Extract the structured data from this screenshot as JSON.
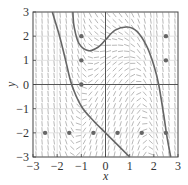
{
  "chart_data": {
    "type": "slope-field",
    "title": "",
    "xlabel": "x",
    "ylabel": "y",
    "xlim": [
      -3,
      3
    ],
    "ylim": [
      -3,
      3
    ],
    "grid": true,
    "x_ticks": [
      "-3",
      "-2",
      "-1",
      "0",
      "1",
      "2",
      "3"
    ],
    "y_ticks": [
      "-3",
      "-2",
      "-1",
      "0",
      "1",
      "2",
      "3"
    ],
    "marked_points": [
      [
        -1,
        2
      ],
      [
        -1,
        1
      ],
      [
        2.5,
        2
      ],
      [
        2.5,
        1
      ],
      [
        -1,
        0
      ],
      [
        -2.5,
        -2
      ],
      [
        -1.5,
        -2
      ],
      [
        -0.5,
        -2
      ],
      [
        0.5,
        -2
      ],
      [
        1.5,
        -2
      ],
      [
        2.5,
        -2
      ]
    ],
    "solution_curves": [
      {
        "name": "curve-a",
        "points": [
          [
            -2.2,
            3
          ],
          [
            -1.9,
            2
          ],
          [
            -1.65,
            1
          ],
          [
            -1.4,
            0
          ],
          [
            -1.0,
            -0.9
          ],
          [
            -0.5,
            -1.5
          ],
          [
            0,
            -2
          ],
          [
            0.5,
            -2.5
          ],
          [
            1.0,
            -3
          ]
        ]
      },
      {
        "name": "curve-b",
        "points": [
          [
            -1.35,
            3
          ],
          [
            -1.3,
            2.4
          ],
          [
            -1.1,
            1.7
          ],
          [
            -0.7,
            1.4
          ],
          [
            -0.3,
            1.55
          ],
          [
            0,
            1.85
          ],
          [
            0.4,
            2.25
          ],
          [
            0.9,
            2.38
          ],
          [
            1.3,
            2.2
          ],
          [
            1.7,
            1.6
          ],
          [
            2.0,
            0.8
          ],
          [
            2.2,
            0
          ],
          [
            2.4,
            -1.2
          ],
          [
            2.55,
            -2.2
          ],
          [
            2.7,
            -3
          ]
        ]
      }
    ],
    "field_grid_step": 0.25,
    "colors": {
      "curve": "#666666",
      "field": "#9a9a9a",
      "axis": "#444444",
      "point": "#666666"
    }
  }
}
